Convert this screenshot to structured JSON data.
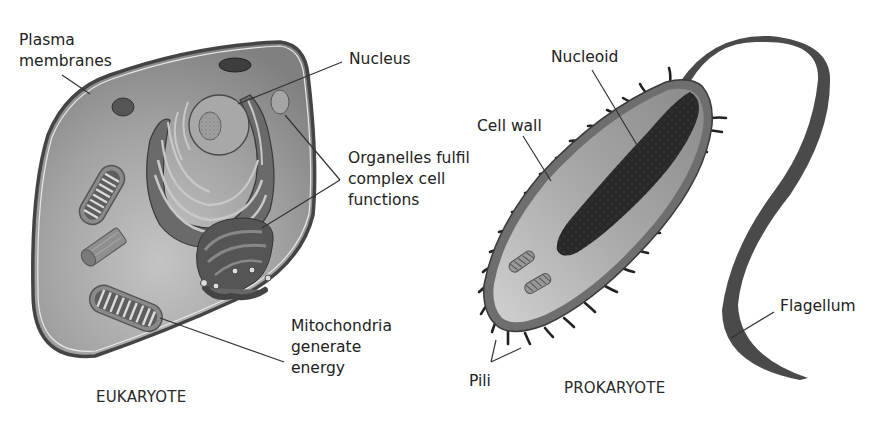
{
  "diagram": {
    "eukaryote": {
      "title": "EUKARYOTE",
      "labels": {
        "plasma_membranes": [
          "Plasma",
          "membranes"
        ],
        "nucleus": "Nucleus",
        "organelles": [
          "Organelles fulfil",
          "complex cell",
          "functions"
        ],
        "mitochondria": [
          "Mitochondria",
          "generate",
          "energy"
        ]
      }
    },
    "prokaryote": {
      "title": "PROKARYOTE",
      "labels": {
        "nucleoid": "Nucleoid",
        "cell_wall": "Cell wall",
        "flagellum": "Flagellum",
        "pili": "Pili"
      }
    },
    "colors": {
      "cytoplasm": "#8e8e8e",
      "cytoplasm_light": "#bdbdbd",
      "organelle_dark": "#5a5a5a",
      "wall": "#6b6b6b",
      "flagellum": "#4a4a4a",
      "text": "#222222"
    }
  }
}
